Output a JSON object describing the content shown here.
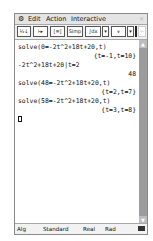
{
  "menubar": {
    "menu_icon": "gear-icon",
    "items": [
      "Edit",
      "Action",
      "Interactive"
    ],
    "close_icon": "close-icon"
  },
  "toolbar": {
    "buttons": [
      {
        "name": "fraction-decimal-toggle",
        "label": "½↓"
      },
      {
        "name": "assign-arrow",
        "label": "⊦▸"
      },
      {
        "name": "simplify-menu",
        "label": "[≡]"
      },
      {
        "name": "simp",
        "label": "Simp"
      },
      {
        "name": "integral-menu",
        "label": "∫dx"
      },
      {
        "name": "integral-dropdown",
        "label": "▾"
      },
      {
        "name": "graph-type",
        "label": "⩛"
      },
      {
        "name": "graph-dropdown",
        "label": "▾"
      },
      {
        "name": "undo",
        "label": "←"
      }
    ]
  },
  "worksheet": {
    "entries": [
      {
        "input": "solve(0=-2t^2+18t+20,t)",
        "output": "{t=-1,t=10}"
      },
      {
        "input": "-2t^2+18t+20|t=2",
        "output": "48"
      },
      {
        "input": "solve(48=-2t^2+18t+20,t)",
        "output": "{t=2,t=7}"
      },
      {
        "input": "solve(58=-2t^2+18t+20,t)",
        "output": "{t=3,t=8}"
      }
    ]
  },
  "scrollbar": {
    "up": "▲",
    "down": "▼"
  },
  "status": {
    "mode": "Alg",
    "format": "Standard",
    "number": "Real",
    "angle": "Rad",
    "battery_icon": "battery-icon"
  }
}
